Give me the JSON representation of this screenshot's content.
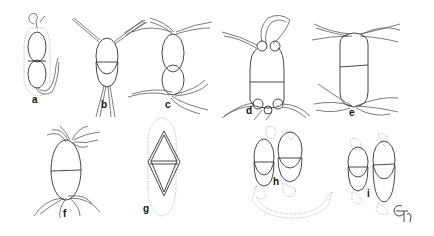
{
  "figure": {
    "panels": [
      {
        "id": "a",
        "label": "a"
      },
      {
        "id": "b",
        "label": "b"
      },
      {
        "id": "c",
        "label": "c"
      },
      {
        "id": "d",
        "label": "d"
      },
      {
        "id": "e",
        "label": "e"
      },
      {
        "id": "f",
        "label": "f"
      },
      {
        "id": "g",
        "label": "g"
      },
      {
        "id": "h",
        "label": "h"
      },
      {
        "id": "i",
        "label": "i"
      }
    ],
    "signature": "Gr",
    "colors": {
      "line": "#333333",
      "dotted": "#9a9a9a",
      "background": "#ffffff"
    }
  }
}
